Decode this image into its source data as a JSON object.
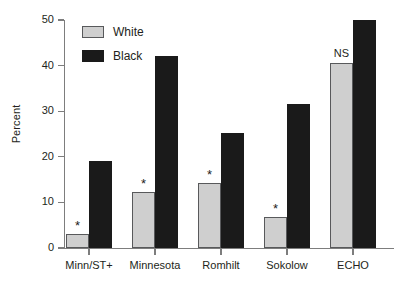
{
  "chart_data": {
    "type": "bar",
    "title": "",
    "xlabel": "",
    "ylabel": "Percent",
    "ylim": [
      0,
      50
    ],
    "yticks": [
      0,
      10,
      20,
      30,
      40,
      50
    ],
    "grid": false,
    "legend_position": "top-left",
    "categories": [
      "Minn/ST+",
      "Minnesota",
      "Romhilt",
      "Sokolow",
      "ECHO"
    ],
    "series": [
      {
        "name": "White",
        "color": "#cfcfcf",
        "values": [
          3.0,
          12.2,
          14.3,
          6.7,
          40.5
        ]
      },
      {
        "name": "Black",
        "color": "#1a1a1a",
        "values": [
          19.0,
          42.0,
          25.3,
          31.5,
          50.0
        ]
      }
    ],
    "annotations": [
      {
        "category": "Minn/ST+",
        "text": "*",
        "series": "White"
      },
      {
        "category": "Minnesota",
        "text": "*",
        "series": "White"
      },
      {
        "category": "Romhilt",
        "text": "*",
        "series": "White"
      },
      {
        "category": "Sokolow",
        "text": "*",
        "series": "White"
      },
      {
        "category": "ECHO",
        "text": "NS",
        "series": "White"
      }
    ]
  },
  "axis": {
    "y_label": "Percent",
    "y_ticks": [
      "0",
      "10",
      "20",
      "30",
      "40",
      "50"
    ],
    "x_ticks": [
      "Minn/ST+",
      "Minnesota",
      "Romhilt",
      "Sokolow",
      "ECHO"
    ]
  },
  "legend": {
    "items": [
      {
        "label": "White"
      },
      {
        "label": "Black"
      }
    ]
  }
}
